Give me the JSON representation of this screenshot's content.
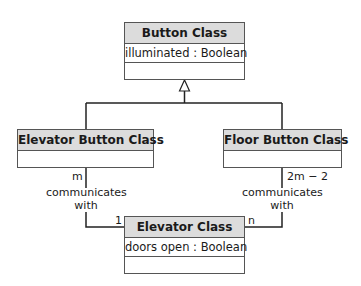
{
  "diagram": {
    "type": "UML class diagram",
    "classes": {
      "button": {
        "name": "Button Class",
        "attributes": [
          "illuminated : Boolean"
        ],
        "operations": []
      },
      "elevator_button": {
        "name": "Elevator Button Class",
        "attributes": [],
        "operations": []
      },
      "floor_button": {
        "name": "Floor Button Class",
        "attributes": [],
        "operations": []
      },
      "elevator": {
        "name": "Elevator Class",
        "attributes": [
          "doors open : Boolean"
        ],
        "operations": []
      }
    },
    "relationships": {
      "generalization": {
        "parent": "Button Class",
        "children": [
          "Elevator Button Class",
          "Floor Button Class"
        ]
      },
      "left_association": {
        "label_line1": "communicates",
        "label_line2": "with",
        "from_multiplicity": "m",
        "to_multiplicity": "1"
      },
      "right_association": {
        "label_line1": "communicates",
        "label_line2": "with",
        "from_multiplicity": "2m − 2",
        "to_multiplicity": "n"
      }
    }
  }
}
